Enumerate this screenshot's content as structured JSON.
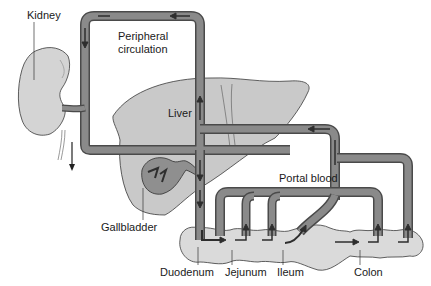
{
  "diagram": {
    "type": "anatomical-circulation",
    "labels": {
      "kidney": "Kidney",
      "peripheral_line1": "Peripheral",
      "peripheral_line2": "circulation",
      "liver": "Liver",
      "portal_blood": "Portal blood",
      "gallbladder": "Gallbladder",
      "duodenum": "Duodenum",
      "jejunum": "Jejunum",
      "ileum": "Ileum",
      "colon": "Colon"
    },
    "colors": {
      "vessel_fill": "#8a8a8a",
      "vessel_stroke": "#4a4a4a",
      "arrow": "#2e2e2e",
      "organ_fill": "#c9c9c9",
      "intestine_fill": "#dadada",
      "outline": "#3a3a3a"
    }
  }
}
